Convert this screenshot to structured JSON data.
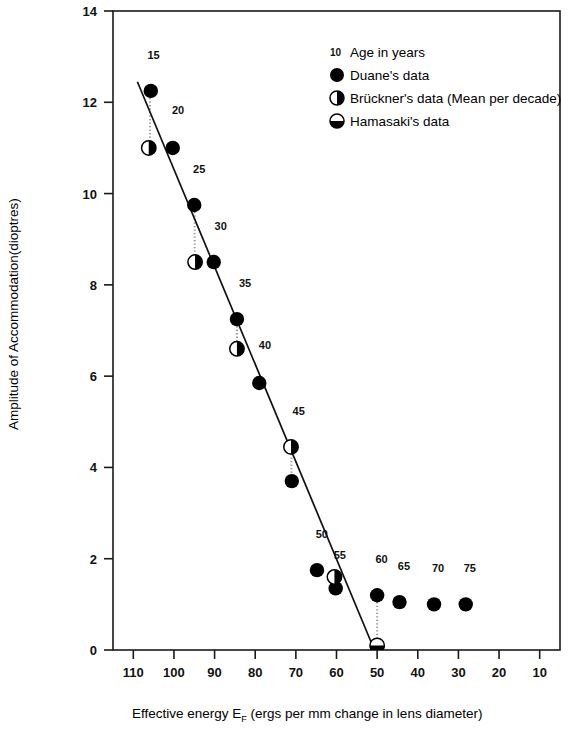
{
  "chart_data": {
    "type": "scatter",
    "title": "",
    "xlabel": "Effective energy  E_F (ergs per mm change in lens diameter)",
    "ylabel": "Amplitude of Accommodation(dioptres)",
    "xlim": [
      115,
      5
    ],
    "ylim": [
      0,
      14
    ],
    "x_reversed": true,
    "grid": false,
    "xticks": [
      110,
      100,
      90,
      80,
      70,
      60,
      50,
      40,
      30,
      20,
      10
    ],
    "yticks": [
      0,
      2,
      4,
      6,
      8,
      10,
      12,
      14
    ],
    "legend_position": "top-right",
    "legend": [
      {
        "marker": "age-number",
        "label": "Age in years",
        "sample": "10"
      },
      {
        "marker": "filled-circle",
        "label": "Duane's data"
      },
      {
        "marker": "right-half-filled-circle",
        "label": "Brückner's data (Mean per decade)"
      },
      {
        "marker": "bottom-half-filled-circle",
        "label": "Hamasaki's data"
      }
    ],
    "series": [
      {
        "name": "Duane's data",
        "marker": "filled-circle",
        "points": [
          {
            "age": 15,
            "x": 105.7,
            "y": 12.25
          },
          {
            "age": 20,
            "x": 100.3,
            "y": 11.0
          },
          {
            "age": 25,
            "x": 95.0,
            "y": 9.75
          },
          {
            "age": 30,
            "x": 90.2,
            "y": 8.5
          },
          {
            "age": 35,
            "x": 84.5,
            "y": 7.25
          },
          {
            "age": 40,
            "x": 79.0,
            "y": 5.85
          },
          {
            "age": 45,
            "x": 71.0,
            "y": 3.7
          },
          {
            "age": 50,
            "x": 64.8,
            "y": 1.75
          },
          {
            "age": 55,
            "x": 60.2,
            "y": 1.35
          },
          {
            "age": 60,
            "x": 50.0,
            "y": 1.2
          },
          {
            "age": 65,
            "x": 44.5,
            "y": 1.05
          },
          {
            "age": 70,
            "x": 36.0,
            "y": 1.0
          },
          {
            "age": 75,
            "x": 28.2,
            "y": 1.0
          }
        ]
      },
      {
        "name": "Brückner's data (Mean per decade)",
        "marker": "right-half-filled-circle",
        "points": [
          {
            "age": 15,
            "x": 106.2,
            "y": 11.0
          },
          {
            "age": 25,
            "x": 94.8,
            "y": 8.5
          },
          {
            "age": 35,
            "x": 84.5,
            "y": 6.6
          },
          {
            "age": 45,
            "x": 71.2,
            "y": 4.45
          },
          {
            "age": 55,
            "x": 60.5,
            "y": 1.6
          }
        ]
      },
      {
        "name": "Hamasaki's data",
        "marker": "bottom-half-filled-circle",
        "points": [
          {
            "age": 60,
            "x": 50.0,
            "y": 0.1
          }
        ]
      }
    ],
    "connector_lines": [
      {
        "x": 105.9,
        "y1": 12.25,
        "y2": 11.0
      },
      {
        "x": 94.9,
        "y1": 9.75,
        "y2": 8.5
      },
      {
        "x": 84.5,
        "y1": 7.25,
        "y2": 6.6
      },
      {
        "x": 71.1,
        "y1": 4.45,
        "y2": 3.7
      },
      {
        "x": 60.3,
        "y1": 1.6,
        "y2": 1.35
      },
      {
        "x": 50.0,
        "y1": 1.2,
        "y2": 0.1
      }
    ],
    "regression_line": {
      "x_start": 109.0,
      "y_start": 12.45,
      "x_end": 50.9,
      "y_end": 0.05
    },
    "age_labels": [
      {
        "text": "15",
        "x": 105.0,
        "y": 12.95
      },
      {
        "text": "20",
        "x": 99.0,
        "y": 11.75
      },
      {
        "text": "25",
        "x": 93.8,
        "y": 10.45
      },
      {
        "text": "30",
        "x": 88.5,
        "y": 9.2
      },
      {
        "text": "35",
        "x": 82.5,
        "y": 7.95
      },
      {
        "text": "40",
        "x": 77.6,
        "y": 6.6
      },
      {
        "text": "45",
        "x": 69.3,
        "y": 5.15
      },
      {
        "text": "50",
        "x": 63.6,
        "y": 2.45
      },
      {
        "text": "55",
        "x": 59.2,
        "y": 2.0
      },
      {
        "text": "60",
        "x": 48.9,
        "y": 1.9
      },
      {
        "text": "65",
        "x": 43.4,
        "y": 1.75
      },
      {
        "text": "70",
        "x": 35.0,
        "y": 1.7
      },
      {
        "text": "75",
        "x": 27.2,
        "y": 1.7
      }
    ]
  },
  "axis": {
    "x_title_main": "Effective energy  E",
    "x_title_sub": "F",
    "x_title_rest": " (ergs per mm change in lens diameter)",
    "y_title": "Amplitude of Accommodation(dioptres)"
  },
  "colors": {
    "marker": "#000000",
    "axis": "#1a1a1a",
    "background": "#ffffff",
    "connector": "#999999"
  }
}
